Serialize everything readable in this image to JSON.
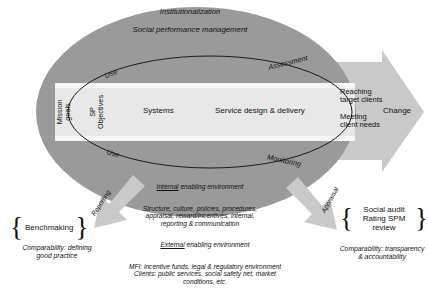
{
  "diagram": {
    "title_labels": {
      "institutionalization": "Institutionalization",
      "social_performance_management": "Social performance management"
    },
    "process_labels": {
      "use_top": "Use",
      "use_bottom": "Use",
      "assessment": "Assessment",
      "monitoring": "Monitoring"
    },
    "band": {
      "mission_goals": "Mission\ngoals",
      "sp_objectives": "SP\nObjectives",
      "systems": "Systems",
      "service_design": "Service design & delivery"
    },
    "outcomes": {
      "reaching": "Reaching\ntarget clients",
      "meeting": "Meeting\nclient needs",
      "change": "Change"
    },
    "arrows": {
      "reporting": "Reporting",
      "appraisal": "Appraisal"
    },
    "internal_environment": {
      "heading_underlined": "Internal",
      "heading_rest": " enabling environment",
      "body": "Structure, culture, policies, procedures,\nappraisal, reward/incentives, internal,\nreporting & communication"
    },
    "external_environment": {
      "heading_underlined": "External",
      "heading_rest": " enabling environment",
      "body": "MFI: incentive funds, legal & regulatory environment\nClients: public services, social safety net, market\nconditions, etc."
    },
    "left_bracket": {
      "items": "Benchmaking",
      "caption": "Comparability: defining\ngood practice"
    },
    "right_bracket": {
      "items": "Social audit\nRating\nSPM review",
      "caption": "Comparability: transparency\n& accountability"
    },
    "colors": {
      "outer_ellipse_fill": "#9a9a9a",
      "band_fill": "#e8e8e8",
      "arrow_fill": "#c9c9c9",
      "stroke": "#1a1a1a",
      "background": "#ffffff"
    }
  }
}
